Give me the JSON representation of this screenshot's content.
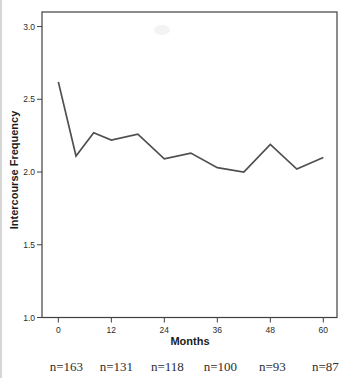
{
  "page": {
    "background": "#ffffff"
  },
  "chart_data": {
    "type": "line",
    "title": "",
    "xlabel": "Months",
    "ylabel": "Intercourse Frequency",
    "x": [
      0,
      4,
      8,
      12,
      18,
      24,
      30,
      36,
      42,
      48,
      54,
      60
    ],
    "y": [
      2.62,
      2.11,
      2.27,
      2.22,
      2.26,
      2.09,
      2.13,
      2.03,
      2.0,
      2.19,
      2.02,
      2.1
    ],
    "series_name": "Intercourse Frequency",
    "xticks": [
      0,
      12,
      24,
      36,
      48,
      60
    ],
    "ytick_values": [
      3.0,
      2.5,
      2.0,
      1.5,
      1.0
    ],
    "ytick_labels": [
      "3.0",
      "2.5",
      "2.0",
      "1.5",
      "1.0"
    ],
    "xlim": [
      -3.7,
      63.1
    ],
    "ylim": [
      1.0,
      3.1
    ],
    "grid": false,
    "legend": "none",
    "line_color": "#4f4f4f",
    "axis_color": "#404040",
    "text_color": "#262626"
  },
  "annotations": {
    "sample_sizes": [
      "n=163",
      "n=131",
      "n=118",
      "n=100",
      "n=93",
      "n=87"
    ]
  }
}
